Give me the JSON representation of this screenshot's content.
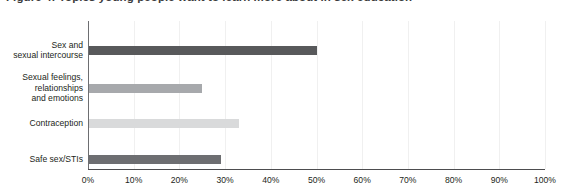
{
  "title_partial": "Figure 4: Topics young people want to learn more about in sex education",
  "chart_data": {
    "type": "bar",
    "orientation": "horizontal",
    "title": "",
    "xlabel": "",
    "ylabel": "",
    "xlim": [
      0,
      100
    ],
    "grid": true,
    "legend": "none",
    "categories": [
      "Sex and\nsexual intercourse",
      "Sexual feelings,\nrelationships\nand emotions",
      "Contraception",
      "Safe sex/STIs"
    ],
    "values": [
      50,
      25,
      33,
      29
    ],
    "value_labels": [
      "50%",
      "25%",
      "33%",
      "29%"
    ],
    "bar_colors": [
      "#58595b",
      "#a7a9ac",
      "#d9dadb",
      "#6d6e71"
    ],
    "tick_labels": [
      "0%",
      "10%",
      "20%",
      "30%",
      "40%",
      "50%",
      "60%",
      "70%",
      "80%",
      "90%",
      "100%"
    ],
    "tick_values": [
      0,
      10,
      20,
      30,
      40,
      50,
      60,
      70,
      80,
      90,
      100
    ],
    "axis_color": "#4d4d4f",
    "gridline_color": "#f0f0f0",
    "background": "#ffffff"
  }
}
